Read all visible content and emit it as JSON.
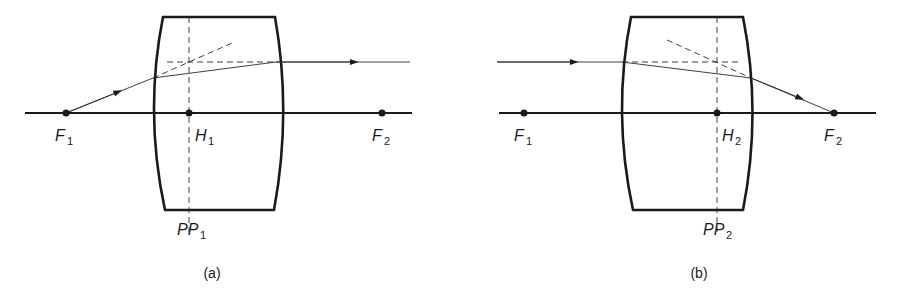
{
  "figure": {
    "panels": [
      {
        "id": "a",
        "caption": "(a)",
        "labels": {
          "f1": {
            "main": "F",
            "sub": "1"
          },
          "h": {
            "main": "H",
            "sub": "1"
          },
          "f2": {
            "main": "F",
            "sub": "2"
          },
          "pp": {
            "main": "PP",
            "sub": "1"
          }
        },
        "description": "Ray from front focal point F1 refracts at first surface, exits parallel to axis; extensions meet at principal plane PP1"
      },
      {
        "id": "b",
        "caption": "(b)",
        "labels": {
          "f1": {
            "main": "F",
            "sub": "1"
          },
          "h": {
            "main": "H",
            "sub": "2"
          },
          "f2": {
            "main": "F",
            "sub": "2"
          },
          "pp": {
            "main": "PP",
            "sub": "2"
          }
        },
        "description": "Ray parallel to axis refracts through thick lens and converges to back focal point F2; extensions meet at principal plane PP2"
      }
    ],
    "colors": {
      "ink": "#1a1a1a",
      "background": "#ffffff"
    }
  }
}
